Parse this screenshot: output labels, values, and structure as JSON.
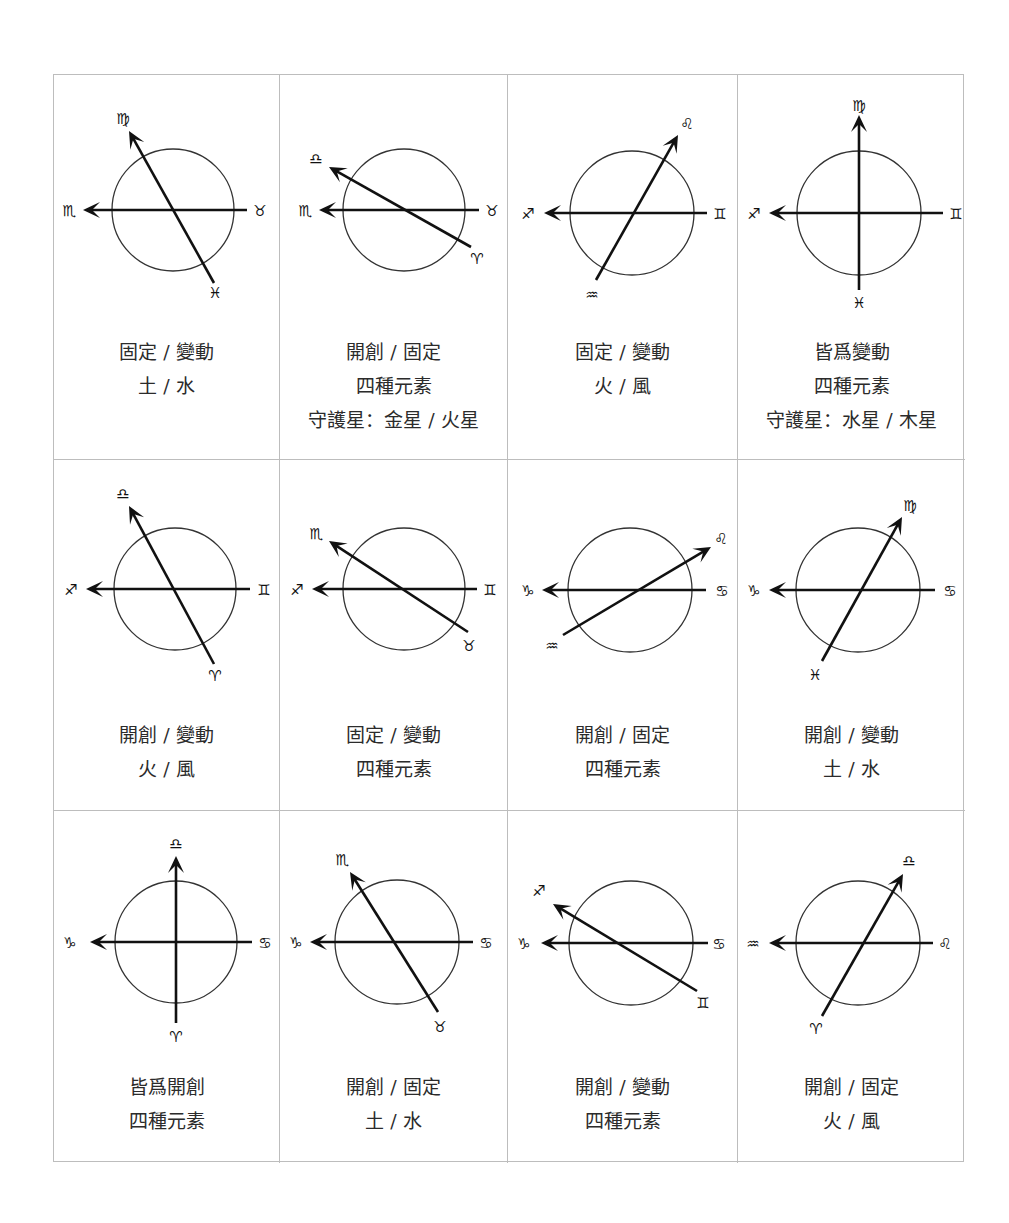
{
  "figure": {
    "title": "",
    "grid": {
      "rows": 3,
      "cols": 4
    },
    "col_x": [
      0,
      226,
      454,
      684,
      911
    ],
    "row_y": [
      0,
      385,
      736,
      1088
    ],
    "line_color": "#111111",
    "circle_color": "#333333",
    "border_color": "#bdbdbd",
    "text_color": "#2b2b2b"
  },
  "cells": [
    {
      "id": "r1c1",
      "circle": {
        "cx": 119,
        "cy": 135,
        "r": 61
      },
      "axis": {
        "x_tip": 29,
        "x_end": 193,
        "y": 135,
        "left_sign": "♏",
        "left_sign_name": "scorpio",
        "right_sign": "♉",
        "right_sign_name": "taurus",
        "left_label_x": 15,
        "right_label_x": 206
      },
      "line": {
        "x1": 160,
        "y1": 208,
        "x2": 75,
        "y2": 56,
        "tail_sign": "♓",
        "tail_sign_name": "pisces",
        "head_sign": "♍",
        "head_sign_name": "virgo",
        "tail_lx": 161,
        "tail_ly": 218,
        "head_lx": 69,
        "head_ly": 44
      },
      "caption_top": 260,
      "lines": [
        "固定 / 變動",
        "土 / 水"
      ]
    },
    {
      "id": "r1c2",
      "circle": {
        "cx": 124,
        "cy": 135,
        "r": 61
      },
      "axis": {
        "x_tip": 39,
        "x_end": 199,
        "y": 135,
        "left_sign": "♏",
        "left_sign_name": "scorpio",
        "right_sign": "♉",
        "right_sign_name": "taurus",
        "left_label_x": 25,
        "right_label_x": 212
      },
      "line": {
        "x1": 191,
        "y1": 172,
        "x2": 49,
        "y2": 92,
        "tail_sign": "♈",
        "tail_sign_name": "aries",
        "head_sign": "♎",
        "head_sign_name": "libra",
        "tail_lx": 197,
        "tail_ly": 184,
        "head_lx": 36,
        "head_ly": 84
      },
      "caption_top": 260,
      "lines": [
        "開創 / 固定",
        "四種元素",
        "守護星：金星 / 火星"
      ]
    },
    {
      "id": "r1c3",
      "circle": {
        "cx": 124,
        "cy": 138,
        "r": 62
      },
      "axis": {
        "x_tip": 36,
        "x_end": 199,
        "y": 138,
        "left_sign": "♐",
        "left_sign_name": "sagittarius",
        "right_sign": "♊",
        "right_sign_name": "gemini",
        "left_label_x": 20,
        "right_label_x": 212
      },
      "line": {
        "x1": 88,
        "y1": 205,
        "x2": 170,
        "y2": 60,
        "tail_sign": "♒",
        "tail_sign_name": "aquarius",
        "head_sign": "♌",
        "head_sign_name": "leo",
        "tail_lx": 84,
        "tail_ly": 220,
        "head_lx": 179,
        "head_ly": 49
      },
      "caption_top": 260,
      "lines": [
        "固定 / 變動",
        "火 / 風"
      ]
    },
    {
      "id": "r1c4",
      "circle": {
        "cx": 121,
        "cy": 138,
        "r": 62
      },
      "axis": {
        "x_tip": 31,
        "x_end": 205,
        "y": 138,
        "left_sign": "♐",
        "left_sign_name": "sagittarius",
        "right_sign": "♊",
        "right_sign_name": "gemini",
        "left_label_x": 16,
        "right_label_x": 218
      },
      "line": {
        "x1": 121,
        "y1": 215,
        "x2": 121,
        "y2": 40,
        "tail_sign": "♓",
        "tail_sign_name": "pisces",
        "head_sign": "♍",
        "head_sign_name": "virgo",
        "tail_lx": 121,
        "tail_ly": 228,
        "head_lx": 121,
        "head_ly": 31
      },
      "caption_top": 260,
      "lines": [
        "皆爲變動",
        "四種元素",
        "守護星：水星 / 木星"
      ]
    },
    {
      "id": "r2c1",
      "circle": {
        "cx": 121,
        "cy": 129,
        "r": 61
      },
      "axis": {
        "x_tip": 32,
        "x_end": 196,
        "y": 129,
        "left_sign": "♐",
        "left_sign_name": "sagittarius",
        "right_sign": "♊",
        "right_sign_name": "gemini",
        "left_label_x": 17,
        "right_label_x": 210
      },
      "line": {
        "x1": 160,
        "y1": 204,
        "x2": 75,
        "y2": 46,
        "tail_sign": "♈",
        "tail_sign_name": "aries",
        "head_sign": "♎",
        "head_sign_name": "libra",
        "tail_lx": 161,
        "tail_ly": 216,
        "head_lx": 69,
        "head_ly": 34
      },
      "caption_top": 258,
      "lines": [
        "開創 / 變動",
        "火 / 風"
      ]
    },
    {
      "id": "r2c2",
      "circle": {
        "cx": 124,
        "cy": 129,
        "r": 61
      },
      "axis": {
        "x_tip": 32,
        "x_end": 197,
        "y": 129,
        "left_sign": "♐",
        "left_sign_name": "sagittarius",
        "right_sign": "♊",
        "right_sign_name": "gemini",
        "left_label_x": 17,
        "right_label_x": 210
      },
      "line": {
        "x1": 188,
        "y1": 172,
        "x2": 49,
        "y2": 81,
        "tail_sign": "♉",
        "tail_sign_name": "taurus",
        "head_sign": "♏",
        "head_sign_name": "scorpio",
        "tail_lx": 189,
        "tail_ly": 186,
        "head_lx": 36,
        "head_ly": 74
      },
      "caption_top": 258,
      "lines": [
        "固定 / 變動",
        "四種元素"
      ]
    },
    {
      "id": "r2c3",
      "circle": {
        "cx": 122,
        "cy": 130,
        "r": 62
      },
      "axis": {
        "x_tip": 34,
        "x_end": 198,
        "y": 130,
        "left_sign": "♑",
        "left_sign_name": "capricorn",
        "right_sign": "♋",
        "right_sign_name": "cancer",
        "left_label_x": 20,
        "right_label_x": 214
      },
      "line": {
        "x1": 55,
        "y1": 175,
        "x2": 203,
        "y2": 87,
        "tail_sign": "♒",
        "tail_sign_name": "aquarius",
        "head_sign": "♌",
        "head_sign_name": "leo",
        "tail_lx": 44,
        "tail_ly": 186,
        "head_lx": 213,
        "head_ly": 79
      },
      "caption_top": 258,
      "lines": [
        "開創 / 固定",
        "四種元素"
      ]
    },
    {
      "id": "r2c4",
      "circle": {
        "cx": 120,
        "cy": 130,
        "r": 62
      },
      "axis": {
        "x_tip": 31,
        "x_end": 197,
        "y": 130,
        "left_sign": "♑",
        "left_sign_name": "capricorn",
        "right_sign": "♋",
        "right_sign_name": "cancer",
        "left_label_x": 16,
        "right_label_x": 212
      },
      "line": {
        "x1": 84,
        "y1": 201,
        "x2": 164,
        "y2": 57,
        "tail_sign": "♓",
        "tail_sign_name": "pisces",
        "head_sign": "♍",
        "head_sign_name": "virgo",
        "tail_lx": 77,
        "tail_ly": 215,
        "head_lx": 172,
        "head_ly": 46
      },
      "caption_top": 258,
      "lines": [
        "開創 / 變動",
        "土 / 水"
      ]
    },
    {
      "id": "r3c1",
      "circle": {
        "cx": 122,
        "cy": 131,
        "r": 61
      },
      "axis": {
        "x_tip": 36,
        "x_end": 198,
        "y": 131,
        "left_sign": "♑",
        "left_sign_name": "capricorn",
        "right_sign": "♋",
        "right_sign_name": "cancer",
        "left_label_x": 16,
        "right_label_x": 211
      },
      "line": {
        "x1": 122,
        "y1": 212,
        "x2": 122,
        "y2": 45,
        "tail_sign": "♈",
        "tail_sign_name": "aries",
        "head_sign": "♎",
        "head_sign_name": "libra",
        "tail_lx": 122,
        "tail_ly": 226,
        "head_lx": 122,
        "head_ly": 33
      },
      "caption_top": 259,
      "lines": [
        "皆爲開創",
        "四種元素"
      ]
    },
    {
      "id": "r3c2",
      "circle": {
        "cx": 117,
        "cy": 131,
        "r": 62
      },
      "axis": {
        "x_tip": 30,
        "x_end": 193,
        "y": 131,
        "left_sign": "♑",
        "left_sign_name": "capricorn",
        "right_sign": "♋",
        "right_sign_name": "cancer",
        "left_label_x": 16,
        "right_label_x": 206
      },
      "line": {
        "x1": 158,
        "y1": 201,
        "x2": 70,
        "y2": 61,
        "tail_sign": "♉",
        "tail_sign_name": "taurus",
        "head_sign": "♏",
        "head_sign_name": "scorpio",
        "tail_lx": 160,
        "tail_ly": 216,
        "head_lx": 62,
        "head_ly": 49
      },
      "caption_top": 259,
      "lines": [
        "開創 / 固定",
        "土 / 水"
      ]
    },
    {
      "id": "r3c3",
      "circle": {
        "cx": 123,
        "cy": 132,
        "r": 62
      },
      "axis": {
        "x_tip": 33,
        "x_end": 200,
        "y": 132,
        "left_sign": "♑",
        "left_sign_name": "capricorn",
        "right_sign": "♋",
        "right_sign_name": "cancer",
        "left_label_x": 16,
        "right_label_x": 211
      },
      "line": {
        "x1": 189,
        "y1": 180,
        "x2": 45,
        "y2": 93,
        "tail_sign": "♊",
        "tail_sign_name": "gemini",
        "head_sign": "♐",
        "head_sign_name": "sagittarius",
        "tail_lx": 195,
        "tail_ly": 192,
        "head_lx": 31,
        "head_ly": 80
      },
      "caption_top": 259,
      "lines": [
        "開創 / 變動",
        "四種元素"
      ]
    },
    {
      "id": "r3c4",
      "circle": {
        "cx": 120,
        "cy": 132,
        "r": 62
      },
      "axis": {
        "x_tip": 31,
        "x_end": 195,
        "y": 132,
        "left_sign": "♒",
        "left_sign_name": "aquarius",
        "right_sign": "♌",
        "right_sign_name": "leo",
        "left_label_x": 15,
        "right_label_x": 207
      },
      "line": {
        "x1": 84,
        "y1": 205,
        "x2": 165,
        "y2": 63,
        "tail_sign": "♈",
        "tail_sign_name": "aries",
        "head_sign": "♎",
        "head_sign_name": "libra",
        "tail_lx": 78,
        "tail_ly": 218,
        "head_lx": 171,
        "head_ly": 50
      },
      "caption_top": 259,
      "lines": [
        "開創 / 固定",
        "火 / 風"
      ]
    }
  ]
}
